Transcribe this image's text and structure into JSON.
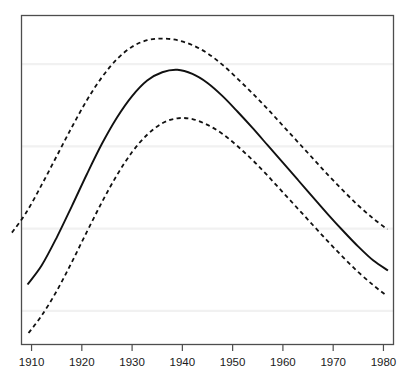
{
  "chart_data": {
    "type": "line",
    "title": "",
    "subtitle": "",
    "xlabel": "",
    "ylabel": "",
    "xlim": [
      1908,
      1982
    ],
    "ylim": [
      0,
      4
    ],
    "grid": "horizontal-only",
    "legend": "none",
    "x_tick_labels": [
      "1910",
      "1920",
      "1930",
      "1940",
      "1950",
      "1960",
      "1970",
      "1980"
    ],
    "x_ticks": [
      1910,
      1920,
      1930,
      1940,
      1950,
      1960,
      1970,
      1980
    ],
    "y_tick_labels": [],
    "y_gridline_values": [
      0.41,
      1.41,
      2.41,
      3.41
    ],
    "annotations": [],
    "series": [
      {
        "name": "Estimate",
        "style": "solid",
        "color": "#111111",
        "x": [
          1909.2,
          1912,
          1915,
          1918,
          1921,
          1924,
          1927,
          1930,
          1933,
          1936,
          1939,
          1942,
          1945,
          1948,
          1951,
          1954,
          1957,
          1960,
          1963,
          1966,
          1969,
          1972,
          1975,
          1978,
          1980.9
        ],
        "y": [
          0.73,
          0.96,
          1.3,
          1.68,
          2.07,
          2.44,
          2.76,
          3.02,
          3.21,
          3.31,
          3.34,
          3.29,
          3.18,
          3.02,
          2.83,
          2.63,
          2.42,
          2.21,
          2.0,
          1.79,
          1.58,
          1.38,
          1.19,
          1.02,
          0.9
        ]
      },
      {
        "name": "Upper confidence limit",
        "style": "dashed",
        "color": "#111111",
        "x": [
          1906.1,
          1909,
          1912,
          1915,
          1918,
          1921,
          1924,
          1927,
          1930,
          1933,
          1936,
          1939,
          1942,
          1945,
          1948,
          1951,
          1954,
          1957,
          1960,
          1963,
          1966,
          1969,
          1972,
          1975,
          1978,
          1980.8
        ],
        "y": [
          1.36,
          1.61,
          1.94,
          2.29,
          2.64,
          2.97,
          3.25,
          3.47,
          3.62,
          3.7,
          3.72,
          3.7,
          3.64,
          3.54,
          3.4,
          3.23,
          3.05,
          2.86,
          2.66,
          2.46,
          2.26,
          2.06,
          1.87,
          1.69,
          1.53,
          1.4
        ]
      },
      {
        "name": "Lower confidence limit",
        "style": "dashed",
        "color": "#111111",
        "x": [
          1909.4,
          1912,
          1915,
          1918,
          1921,
          1924,
          1927,
          1930,
          1933,
          1936,
          1939,
          1942,
          1945,
          1948,
          1951,
          1954,
          1957,
          1960,
          1963,
          1966,
          1969,
          1972,
          1975,
          1978,
          1980.7
        ],
        "y": [
          0.14,
          0.35,
          0.65,
          1.0,
          1.37,
          1.73,
          2.06,
          2.34,
          2.55,
          2.69,
          2.75,
          2.74,
          2.67,
          2.56,
          2.41,
          2.24,
          2.05,
          1.85,
          1.65,
          1.45,
          1.25,
          1.06,
          0.88,
          0.72,
          0.59
        ]
      }
    ],
    "colors": {
      "axis": "#4d4d4d",
      "gridline": "#f1f1f1",
      "curve": "#111111",
      "background": "#ffffff",
      "tick_text": "#1a1a1a"
    }
  }
}
